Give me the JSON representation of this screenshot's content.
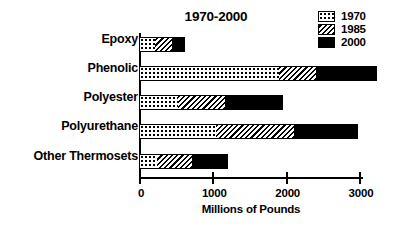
{
  "chart_data": {
    "type": "bar",
    "orientation": "horizontal",
    "stacked": true,
    "title": "1970-2000",
    "xlabel": "Millions of Pounds",
    "ylabel": "",
    "xlim": [
      0,
      3300
    ],
    "xticks": [
      0,
      1000,
      2000,
      3000
    ],
    "xtick_labels": [
      "0",
      "1000",
      "2000",
      "3000"
    ],
    "grid": false,
    "legend_position": "top-right",
    "categories": [
      "Epoxy",
      "Phenolic",
      "Polyester",
      "Polyurethane",
      "Other Thermosets"
    ],
    "series": [
      {
        "name": "1970",
        "pattern": "dots",
        "values": [
          200,
          1900,
          520,
          1040,
          230
        ]
      },
      {
        "name": "1985",
        "pattern": "hatch",
        "values": [
          430,
          2400,
          1160,
          2100,
          710
        ]
      },
      {
        "name": "2000",
        "pattern": "solid",
        "values": [
          610,
          3230,
          1950,
          2970,
          1200
        ]
      }
    ],
    "note": "Series values are cumulative stacked end-points read off the axis"
  },
  "legend": {
    "items": [
      {
        "label": "1970",
        "pattern": "dots"
      },
      {
        "label": "1985",
        "pattern": "hatch"
      },
      {
        "label": "2000",
        "pattern": "solid"
      }
    ]
  },
  "colors": {
    "ink": "#000000",
    "paper": "#ffffff"
  }
}
